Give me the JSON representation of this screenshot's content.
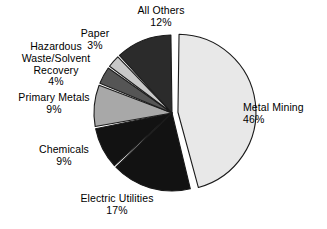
{
  "chart_data": {
    "type": "pie",
    "title": "",
    "subtitle": "",
    "xlabel": "",
    "ylabel": "",
    "legend": "none",
    "grid": false,
    "labels_position": "outside-perimeter",
    "value_suffix": "%",
    "total": 100,
    "categories": [
      "Metal Mining",
      "All Others",
      "Paper",
      "Hazardous Waste/Solvent Recovery",
      "Primary Metals",
      "Chemicals",
      "Electric Utilities"
    ],
    "values": [
      46,
      12,
      3,
      4,
      9,
      9,
      17
    ],
    "slices": [
      {
        "name": "Metal Mining",
        "name_line1": "Metal Mining",
        "value": 46,
        "value_label": "46%",
        "color": "#e8e8e8",
        "exploded": true
      },
      {
        "name": "All Others",
        "name_line1": "All Others",
        "value": 12,
        "value_label": "12%",
        "color": "#2b2b2b",
        "exploded": false
      },
      {
        "name": "Paper",
        "name_line1": "Paper",
        "value": 3,
        "value_label": "3%",
        "color": "#c8c8c8",
        "exploded": false
      },
      {
        "name": "Hazardous Waste/Solvent Recovery",
        "name_line1": "Hazardous",
        "name_line2": "Waste/Solvent",
        "name_line3": "Recovery",
        "value": 4,
        "value_label": "4%",
        "color": "#555555",
        "exploded": false
      },
      {
        "name": "Primary Metals",
        "name_line1": "Primary Metals",
        "value": 9,
        "value_label": "9%",
        "color": "#a8a8a8",
        "exploded": false
      },
      {
        "name": "Chemicals",
        "name_line1": "Chemicals",
        "value": 9,
        "value_label": "9%",
        "color": "#121212",
        "exploded": false
      },
      {
        "name": "Electric Utilities",
        "name_line1": "Electric Utilities",
        "value": 17,
        "value_label": "17%",
        "color": "#121212",
        "exploded": false
      }
    ],
    "colors": {
      "background": "#ffffff",
      "text": "#000000",
      "slice_outline": "#1a1a1a",
      "slice_gap": "#ffffff"
    }
  }
}
